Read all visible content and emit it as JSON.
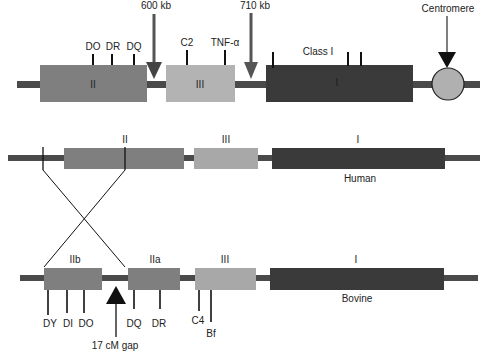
{
  "colors": {
    "class_ii": "#7f7f7f",
    "class_iii": "#b3b3b3",
    "class_i": "#3a3a3a",
    "chromosome": "#4a4a4a",
    "centromere": "#b0b0b0",
    "arrow": "#555555",
    "text": "#222222"
  },
  "top": {
    "region_labels": {
      "class_ii": "II",
      "class_iii": "III",
      "class_i": "I",
      "class_i_title": "Class I"
    },
    "genes": {
      "do": "DO",
      "dr": "DR",
      "dq": "DQ",
      "c2": "C2",
      "tnf": "TNF-α"
    },
    "arrows": {
      "kb600": "600 kb",
      "kb710": "710 kb",
      "centromere": "Centromere"
    }
  },
  "human": {
    "label": "Human",
    "region_labels": {
      "class_ii": "II",
      "class_iii": "III",
      "class_i": "I"
    }
  },
  "bovine": {
    "label": "Bovine",
    "region_labels": {
      "class_iib": "IIb",
      "class_iia": "IIa",
      "class_iii": "III",
      "class_i": "I"
    },
    "genes": {
      "dy": "DY",
      "di": "DI",
      "do": "DO",
      "dq": "DQ",
      "dr": "DR",
      "c4": "C4",
      "bf": "Bf"
    },
    "gap_label": "17 cM gap"
  }
}
